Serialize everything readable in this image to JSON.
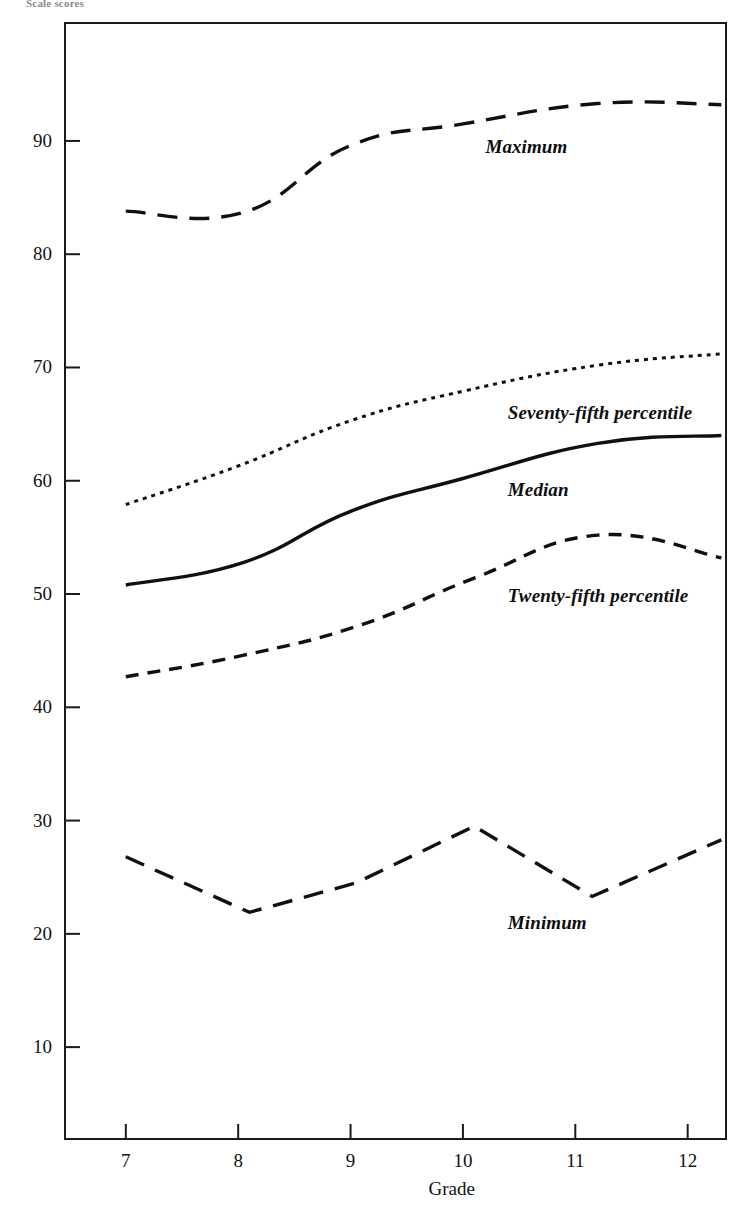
{
  "figure": {
    "yaxis_title": "Scale scores",
    "xaxis_title": "Grade"
  },
  "axes": {
    "y_ticks": [
      {
        "value": 90,
        "label": "90"
      },
      {
        "value": 80,
        "label": "80"
      },
      {
        "value": 70,
        "label": "70"
      },
      {
        "value": 60,
        "label": "60"
      },
      {
        "value": 50,
        "label": "50"
      },
      {
        "value": 40,
        "label": "40"
      },
      {
        "value": 30,
        "label": "30"
      },
      {
        "value": 20,
        "label": "20"
      },
      {
        "value": 10,
        "label": "10"
      }
    ],
    "x_ticks": [
      {
        "value": 7,
        "label": "7"
      },
      {
        "value": 8,
        "label": "8"
      },
      {
        "value": 9,
        "label": "9"
      },
      {
        "value": 10,
        "label": "10"
      },
      {
        "value": 11,
        "label": "11"
      },
      {
        "value": 12,
        "label": "12"
      }
    ]
  },
  "chart_data": {
    "type": "line",
    "title": "",
    "subtitle": "",
    "xlabel": "Grade",
    "ylabel": "Scale scores",
    "xlim": [
      6.45,
      12.35
    ],
    "ylim": [
      1.8,
      100.5
    ],
    "grid": false,
    "legend": "inline-annotations",
    "x": [
      7,
      8,
      9,
      10,
      11,
      12
    ],
    "series": [
      {
        "name": "Maximum",
        "style": "long-dash",
        "label_position": {
          "x": 10.2,
          "y": 89.5
        },
        "values": [
          83.8,
          83.8,
          89.6,
          91.6,
          93.2,
          93.2
        ],
        "points": [
          {
            "x": 7.0,
            "y": 83.8
          },
          {
            "x": 8.05,
            "y": 83.7
          },
          {
            "x": 9.0,
            "y": 89.6
          },
          {
            "x": 10.0,
            "y": 91.5
          },
          {
            "x": 11.2,
            "y": 93.3
          },
          {
            "x": 12.3,
            "y": 93.2
          }
        ]
      },
      {
        "name": "Seventy-fifth percentile",
        "style": "dotted",
        "label_position": {
          "x": 10.4,
          "y": 66.0
        },
        "values": [
          57.9,
          61.2,
          65.2,
          67.8,
          70.1,
          71.2
        ],
        "points": [
          {
            "x": 7.0,
            "y": 57.9
          },
          {
            "x": 8.0,
            "y": 61.3
          },
          {
            "x": 9.0,
            "y": 65.3
          },
          {
            "x": 10.0,
            "y": 67.9
          },
          {
            "x": 11.2,
            "y": 70.2
          },
          {
            "x": 12.3,
            "y": 71.2
          }
        ]
      },
      {
        "name": "Median",
        "style": "solid",
        "label_position": {
          "x": 10.4,
          "y": 59.2
        },
        "values": [
          50.8,
          52.8,
          57.3,
          60.3,
          63.2,
          64.0
        ],
        "points": [
          {
            "x": 7.0,
            "y": 50.8
          },
          {
            "x": 8.05,
            "y": 52.8
          },
          {
            "x": 9.0,
            "y": 57.3
          },
          {
            "x": 10.0,
            "y": 60.2
          },
          {
            "x": 11.2,
            "y": 63.3
          },
          {
            "x": 12.3,
            "y": 64.0
          }
        ]
      },
      {
        "name": "Twenty-fifth percentile",
        "style": "dash",
        "label_position": {
          "x": 10.4,
          "y": 49.8
        },
        "values": [
          42.7,
          44.6,
          47.3,
          51.3,
          55.2,
          53.2
        ],
        "points": [
          {
            "x": 7.0,
            "y": 42.7
          },
          {
            "x": 8.05,
            "y": 44.6
          },
          {
            "x": 9.1,
            "y": 47.3
          },
          {
            "x": 10.1,
            "y": 51.4
          },
          {
            "x": 11.2,
            "y": 55.2
          },
          {
            "x": 12.3,
            "y": 53.2
          }
        ]
      },
      {
        "name": "Minimum",
        "style": "long-dash",
        "label_position": {
          "x": 10.4,
          "y": 21.0
        },
        "values": [
          26.8,
          21.9,
          24.5,
          29.5,
          23.3,
          28.3
        ],
        "points": [
          {
            "x": 7.0,
            "y": 26.8
          },
          {
            "x": 8.1,
            "y": 21.9
          },
          {
            "x": 9.05,
            "y": 24.5
          },
          {
            "x": 10.1,
            "y": 29.5
          },
          {
            "x": 11.15,
            "y": 23.3
          },
          {
            "x": 12.3,
            "y": 28.3
          }
        ]
      }
    ]
  }
}
